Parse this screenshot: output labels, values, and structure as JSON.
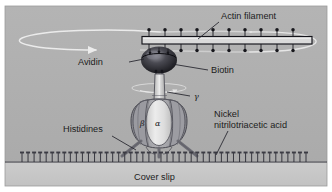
{
  "figure": {
    "domain": "Diagram",
    "title_visible": false,
    "width": 332,
    "height": 192
  },
  "canvas": {
    "outer_background": "#ffffff",
    "panel_background_top": "#aeaeae",
    "panel_background_bottom": "#c9c9c9",
    "panel_border": "#9a9a9a",
    "coverslip_line": "#3a3a3a"
  },
  "labels": {
    "actin_filament": "Actin filament",
    "avidin": "Avidin",
    "biotin": "Biotin",
    "gamma": "γ",
    "beta": "β",
    "alpha": "α",
    "histidines": "Histidines",
    "nickel_nta_line1": "Nickel",
    "nickel_nta_line2": "nitrilotriacetic acid",
    "cover_slip": "Cover slip"
  },
  "colors": {
    "actin_bar_fill": "#d8d8d8",
    "actin_bar_stroke": "#15151a",
    "biotin_dot": "#17171c",
    "avidin_dark": "#1d1d22",
    "avidin_highlight": "#8f8f96",
    "gamma_shaft": "#d2d2d2",
    "alpha_fill": "#e3e3e3",
    "beta_fill": "#9e9e9e",
    "motor_stroke": "#4a4a52",
    "histidine_arm": "#6f6f76",
    "nta_color": "#3c3c44",
    "rotation_arrow": "#f2f2f2",
    "text": "#1c1c1c"
  },
  "components": {
    "actin_filament": {
      "name": "actin filament",
      "biotin_count_top": 11,
      "biotin_count_bottom": 11,
      "x_start": 142,
      "x_end": 312,
      "y": 40
    },
    "biotin": {
      "name": "biotin",
      "depiction": "lollipop dots above and below filament"
    },
    "avidin": {
      "name": "avidin",
      "depiction": "dark ellipsoid linker",
      "cx": 159,
      "cy": 60
    },
    "gamma_subunit": {
      "name": "gamma subunit shaft",
      "depiction": "vertical rotating shaft"
    },
    "alpha_beta_complex": {
      "name": "alpha3 beta3 hexamer",
      "depiction": "barrel of alternating alpha and beta subunits"
    },
    "histidine_tags": {
      "name": "histidine tags",
      "count": 3,
      "depiction": "legs anchoring complex to surface"
    },
    "nickel_nta_layer": {
      "name": "nickel nitrilotriacetic acid monolayer",
      "pin_count": 48,
      "depiction": "row of surface-bound pins"
    },
    "cover_slip": {
      "name": "cover slip",
      "depiction": "glass substrate below the monolayer"
    },
    "rotation_indicators": {
      "large_ellipse": "rotation of actin filament",
      "small_ellipse": "rotation of gamma shaft",
      "arrowhead_direction": "clockwise viewed from above"
    }
  },
  "leader_lines": [
    {
      "from": "actin_filament",
      "to": "filament bar"
    },
    {
      "from": "avidin",
      "to": "avidin ellipsoid"
    },
    {
      "from": "biotin",
      "to": "biotin dot on filament"
    },
    {
      "from": "gamma",
      "to": "gamma shaft"
    },
    {
      "from": "histidines",
      "to": "histidine leg"
    },
    {
      "from": "nickel_nta",
      "to": "surface pin"
    }
  ]
}
